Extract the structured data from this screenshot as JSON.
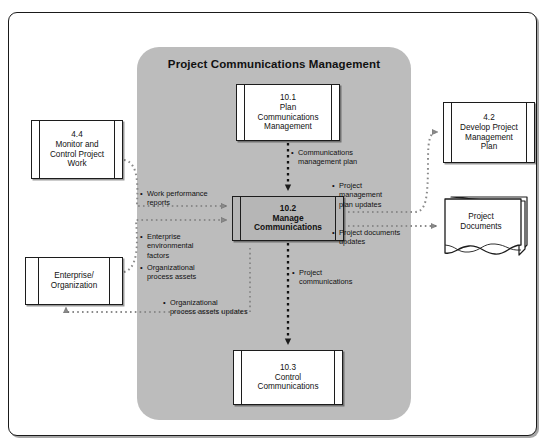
{
  "diagram": {
    "title": "Project Communications Management",
    "type": "data-flow-diagram",
    "accent_panel_color": "#bcbcbc",
    "highlight_box_color": "#b6b6b6",
    "line_color": "#8a8a8a",
    "border_color": "#1c1c1c"
  },
  "panel": {
    "title": "Project Communications Management"
  },
  "processes": {
    "plan": {
      "id": "10.1",
      "line1": "Plan",
      "line2": "Communications",
      "line3": "Management",
      "full": "10.1 Plan Communications Management"
    },
    "manage": {
      "id": "10.2",
      "line1": "Manage",
      "line2": "Communications",
      "full": "10.2 Manage Communications"
    },
    "control": {
      "id": "10.3",
      "line1": "Control",
      "line2": "Communications",
      "full": "10.3 Control Communications"
    }
  },
  "external": {
    "monitor_control": {
      "id": "4.4",
      "line1": "Monitor and",
      "line2": "Control Project",
      "line3": "Work",
      "full": "4.4 Monitor and Control Project Work"
    },
    "develop_pm_plan": {
      "id": "4.2",
      "line1": "Develop Project",
      "line2": "Management",
      "line3": "Plan",
      "full": "4.2 Develop Project Management Plan"
    },
    "enterprise": {
      "line1": "Enterprise/",
      "line2": "Organization",
      "full": "Enterprise/Organization"
    },
    "project_documents": {
      "line1": "Project",
      "line2": "Documents",
      "full": "Project Documents"
    }
  },
  "flows": {
    "communications_management_plan": {
      "line1": "Communications",
      "line2": "management plan"
    },
    "work_performance_reports": {
      "line1": "Work performance",
      "line2": "reports"
    },
    "enterprise_environmental_factors": {
      "line1": "Enterprise",
      "line2": "environmental",
      "line3": "factors"
    },
    "organizational_process_assets": {
      "line1": "Organizational",
      "line2": "process assets"
    },
    "organizational_process_assets_updates": {
      "line1": "Organizational",
      "line2": "process assets updates"
    },
    "project_management_plan_updates": {
      "line1": "Project",
      "line2": "management",
      "line3": "plan updates"
    },
    "project_documents_updates": {
      "line1": "Project documents",
      "line2": "updates"
    },
    "project_communications": {
      "line1": "Project",
      "line2": "communications"
    }
  }
}
